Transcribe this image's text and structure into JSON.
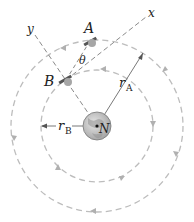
{
  "diagram": {
    "type": "orbital-mechanics",
    "labels": {
      "satellite_a": "A",
      "satellite_b": "B",
      "planet": "N",
      "x_axis": "x",
      "y_axis": "y",
      "angle": "θ",
      "radius_a": "r",
      "radius_a_sub": "A",
      "radius_b": "r",
      "radius_b_sub": "B"
    },
    "orbits": [
      {
        "name": "inner-orbit",
        "radius_label": "r_B",
        "direction": "counterclockwise"
      },
      {
        "name": "outer-orbit",
        "radius_label": "r_A",
        "direction": "counterclockwise"
      }
    ],
    "colors": {
      "orbit": "#b8b8b8",
      "axis": "#8a8a8a",
      "planet_fill": "#c8c8c8",
      "satellite": "#9a9a9a",
      "text": "#222222"
    }
  }
}
